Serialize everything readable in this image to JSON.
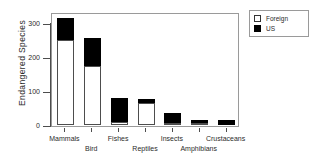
{
  "chart_data": {
    "type": "bar",
    "subtype": "stacked-vertical",
    "title": "",
    "xlabel": "",
    "ylabel": "Endangered Species",
    "categories": [
      "Mammals",
      "Bird",
      "Fishes",
      "Reptiles",
      "Insects",
      "Amphibians",
      "Crustaceans"
    ],
    "series": [
      {
        "name": "Foreign",
        "values": [
          250,
          175,
          10,
          65,
          5,
          5,
          1
        ],
        "color": "#ffffff"
      },
      {
        "name": "US",
        "values": [
          65,
          80,
          70,
          13,
          30,
          10,
          14
        ],
        "color": "#000000"
      }
    ],
    "totals": [
      315,
      255,
      80,
      78,
      35,
      15,
      15
    ],
    "ylim": [
      0,
      330
    ],
    "yticks": [
      0,
      100,
      200,
      300
    ],
    "ytick_labels": [
      "0",
      "100",
      "200",
      "300"
    ],
    "grid": false,
    "legend_position": "top-right",
    "legend_entries": [
      {
        "label": "Foreign",
        "marker": "open-square"
      },
      {
        "label": "US",
        "marker": "filled-square"
      }
    ]
  },
  "axes": {
    "y_title": "Endangered Species",
    "y_ticks": [
      {
        "label": "300",
        "value": 300
      },
      {
        "label": "200",
        "value": 200
      },
      {
        "label": "100",
        "value": 100
      },
      {
        "label": "0",
        "value": 0
      }
    ],
    "x_categories": [
      {
        "label": "Mammals",
        "row": 0
      },
      {
        "label": "Bird",
        "row": 1
      },
      {
        "label": "Fishes",
        "row": 0
      },
      {
        "label": "Reptiles",
        "row": 1
      },
      {
        "label": "Insects",
        "row": 0
      },
      {
        "label": "Amphibians",
        "row": 1
      },
      {
        "label": "Crustaceans",
        "row": 0
      }
    ]
  },
  "legend": {
    "items": [
      {
        "label": "Foreign",
        "swatch": "open-square"
      },
      {
        "label": "US",
        "swatch": "filled-square"
      }
    ]
  },
  "colors": {
    "foreign": "#ffffff",
    "us": "#000000",
    "axis": "#4d4d4d",
    "frame": "#9a9a9a",
    "background": "#ffffff"
  }
}
